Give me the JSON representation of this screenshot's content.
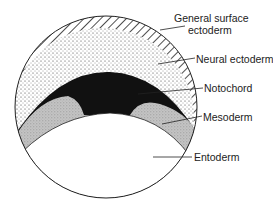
{
  "diagram": {
    "labels": {
      "general_surface_ectoderm_line1": "General surface",
      "general_surface_ectoderm_line2": "ectoderm",
      "neural_ectoderm": "Neural ectoderm",
      "notochord": "Notochord",
      "mesoderm": "Mesoderm",
      "entoderm": "Entoderm"
    },
    "colors": {
      "outline": "#222222",
      "notochord": "#111111",
      "mesoderm": "#bdbdbd",
      "neural_dots": "#333333",
      "entoderm": "#ffffff"
    }
  }
}
